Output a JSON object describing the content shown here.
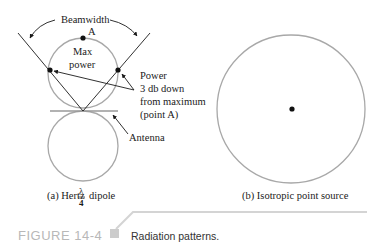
{
  "diagram": {
    "panel_a": {
      "labels": {
        "beamwidth": "Beamwidth",
        "point_a": "A",
        "max_power_line1": "Max",
        "max_power_line2": "power",
        "power_note_line1": "Power",
        "power_note_line2": "3 db down",
        "power_note_line3": "from maximum",
        "power_note_line4": "(point A)",
        "antenna": "Antenna"
      },
      "caption_prefix": "(a) Hertz",
      "caption_frac_num": "λ",
      "caption_frac_den": "4",
      "caption_suffix": "dipole"
    },
    "panel_b": {
      "caption": "(b) Isotropic point source"
    }
  },
  "figure": {
    "number": "FIGURE 14-4",
    "caption": "Radiation patterns."
  },
  "colors": {
    "pattern_stroke": "#a8a8a8",
    "line_stroke": "#1a1a1a",
    "figure_number": "#b8b8b8",
    "marker_square": "#cccccc",
    "rule": "#d4d4d4"
  }
}
